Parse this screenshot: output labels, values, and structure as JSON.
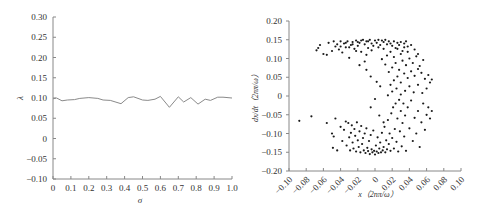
{
  "chart_data": [
    {
      "type": "line",
      "title": "",
      "xlabel": "σ",
      "ylabel": "λ",
      "xlim": [
        0,
        1.0
      ],
      "ylim": [
        -0.1,
        0.3
      ],
      "xticks": [
        "0",
        "0.1",
        "0.2",
        "0.3",
        "0.4",
        "0.5",
        "0.6",
        "0.7",
        "0.8",
        "0.9",
        "1.0"
      ],
      "xtick_values": [
        0,
        0.1,
        0.2,
        0.3,
        0.4,
        0.5,
        0.6,
        0.7,
        0.8,
        0.9,
        1.0
      ],
      "yticks": [
        "0.30",
        "0.25",
        "0.20",
        "0.15",
        "0.10",
        "0.05",
        "0",
        "−0.05",
        "−0.10"
      ],
      "ytick_values": [
        0.3,
        0.25,
        0.2,
        0.15,
        0.1,
        0.05,
        0,
        -0.05,
        -0.1
      ],
      "grid": false,
      "series": [
        {
          "name": "λ",
          "x": [
            0,
            0.02,
            0.05,
            0.08,
            0.12,
            0.15,
            0.2,
            0.25,
            0.28,
            0.32,
            0.38,
            0.42,
            0.45,
            0.5,
            0.53,
            0.57,
            0.6,
            0.65,
            0.7,
            0.73,
            0.77,
            0.81,
            0.85,
            0.88,
            0.92,
            0.95,
            1.0
          ],
          "y": [
            0.098,
            0.1,
            0.093,
            0.095,
            0.096,
            0.099,
            0.101,
            0.099,
            0.095,
            0.094,
            0.086,
            0.101,
            0.103,
            0.095,
            0.094,
            0.097,
            0.104,
            0.077,
            0.103,
            0.09,
            0.101,
            0.085,
            0.097,
            0.094,
            0.102,
            0.102,
            0.1
          ]
        }
      ]
    },
    {
      "type": "scatter",
      "title": "",
      "xlabel": "x（2nπ/ω）",
      "ylabel": "dx/dt（2nπ/ω）",
      "xlim": [
        -0.1,
        0.1
      ],
      "ylim": [
        -0.2,
        0.2
      ],
      "xticks": [
        "−0.10",
        "−0.08",
        "−0.06",
        "−0.04",
        "−0.02",
        "0",
        "0.02",
        "0.04",
        "0.06",
        "0.08",
        "0.10"
      ],
      "xtick_values": [
        -0.1,
        -0.08,
        -0.06,
        -0.04,
        -0.02,
        0,
        0.02,
        0.04,
        0.06,
        0.08,
        0.1
      ],
      "yticks": [
        "0.20",
        "0.15",
        "0.10",
        "0.05",
        "0",
        "−0.05",
        "−0.10",
        "−0.15",
        "−0.20"
      ],
      "ytick_values": [
        0.2,
        0.15,
        0.1,
        0.05,
        0,
        -0.05,
        -0.1,
        -0.15,
        -0.2
      ],
      "grid": false,
      "points": [
        [
          -0.088,
          -0.066
        ],
        [
          -0.074,
          -0.054
        ],
        [
          -0.056,
          -0.072
        ],
        [
          -0.05,
          -0.1
        ],
        [
          -0.048,
          -0.108
        ],
        [
          -0.046,
          -0.06
        ],
        [
          -0.049,
          -0.138
        ],
        [
          -0.044,
          -0.145
        ],
        [
          -0.04,
          -0.082
        ],
        [
          -0.038,
          -0.12
        ],
        [
          -0.036,
          -0.09
        ],
        [
          -0.034,
          -0.068
        ],
        [
          -0.033,
          -0.132
        ],
        [
          -0.031,
          -0.072
        ],
        [
          -0.03,
          -0.11
        ],
        [
          -0.029,
          -0.145
        ],
        [
          -0.028,
          -0.098
        ],
        [
          -0.027,
          -0.078
        ],
        [
          -0.026,
          -0.124
        ],
        [
          -0.025,
          -0.14
        ],
        [
          -0.024,
          -0.088
        ],
        [
          -0.023,
          -0.106
        ],
        [
          -0.022,
          -0.148
        ],
        [
          -0.021,
          -0.07
        ],
        [
          -0.02,
          -0.118
        ],
        [
          -0.019,
          -0.136
        ],
        [
          -0.018,
          -0.094
        ],
        [
          -0.017,
          -0.15
        ],
        [
          -0.016,
          -0.08
        ],
        [
          -0.015,
          -0.128
        ],
        [
          -0.014,
          -0.112
        ],
        [
          -0.013,
          -0.145
        ],
        [
          -0.012,
          -0.1
        ],
        [
          -0.011,
          -0.152
        ],
        [
          -0.01,
          -0.086
        ],
        [
          -0.009,
          -0.138
        ],
        [
          -0.008,
          -0.147
        ],
        [
          -0.007,
          -0.12
        ],
        [
          -0.006,
          -0.155
        ],
        [
          -0.005,
          -0.104
        ],
        [
          -0.004,
          -0.142
        ],
        [
          -0.003,
          -0.15
        ],
        [
          -0.002,
          -0.092
        ],
        [
          -0.001,
          -0.146
        ],
        [
          0.0,
          -0.156
        ],
        [
          0.001,
          -0.132
        ],
        [
          0.002,
          -0.148
        ],
        [
          0.003,
          -0.11
        ],
        [
          0.004,
          -0.152
        ],
        [
          0.005,
          -0.14
        ],
        [
          0.006,
          -0.124
        ],
        [
          0.007,
          -0.15
        ],
        [
          0.008,
          -0.098
        ],
        [
          0.009,
          -0.145
        ],
        [
          0.01,
          -0.136
        ],
        [
          0.011,
          -0.082
        ],
        [
          0.012,
          -0.15
        ],
        [
          0.013,
          -0.118
        ],
        [
          0.014,
          -0.142
        ],
        [
          0.015,
          -0.064
        ],
        [
          0.016,
          -0.128
        ],
        [
          0.017,
          -0.1
        ],
        [
          0.018,
          -0.146
        ],
        [
          0.019,
          -0.046
        ],
        [
          0.02,
          -0.112
        ],
        [
          0.021,
          -0.03
        ],
        [
          0.022,
          -0.14
        ],
        [
          0.023,
          -0.088
        ],
        [
          0.024,
          -0.02
        ],
        [
          0.025,
          -0.122
        ],
        [
          0.026,
          -0.06
        ],
        [
          0.027,
          -0.148
        ],
        [
          0.028,
          -0.01
        ],
        [
          0.029,
          -0.094
        ],
        [
          0.03,
          -0.04
        ],
        [
          0.031,
          -0.134
        ],
        [
          0.032,
          -0.072
        ],
        [
          0.033,
          -0.02
        ],
        [
          0.034,
          -0.108
        ],
        [
          0.035,
          -0.052
        ],
        [
          0.036,
          -0.146
        ],
        [
          0.038,
          -0.03
        ],
        [
          0.04,
          -0.086
        ],
        [
          0.042,
          -0.012
        ],
        [
          0.044,
          -0.12
        ],
        [
          0.046,
          -0.058
        ],
        [
          0.048,
          -0.1
        ],
        [
          0.05,
          -0.04
        ],
        [
          0.052,
          -0.136
        ],
        [
          0.054,
          -0.07
        ],
        [
          0.056,
          -0.02
        ],
        [
          0.058,
          -0.09
        ],
        [
          0.06,
          -0.05
        ],
        [
          0.062,
          -0.03
        ],
        [
          0.064,
          -0.06
        ],
        [
          0.066,
          -0.04
        ],
        [
          0.01,
          -0.07
        ],
        [
          0.005,
          -0.052
        ],
        [
          -0.005,
          -0.03
        ],
        [
          0.0,
          -0.008
        ],
        [
          0.015,
          0.002
        ],
        [
          0.02,
          0.012
        ],
        [
          0.025,
          0.02
        ],
        [
          0.03,
          0.004
        ],
        [
          0.035,
          0.014
        ],
        [
          0.04,
          0.026
        ],
        [
          0.045,
          0.01
        ],
        [
          0.05,
          0.03
        ],
        [
          0.055,
          0.008
        ],
        [
          0.06,
          0.02
        ],
        [
          0.064,
          0.036
        ],
        [
          0.066,
          0.044
        ],
        [
          0.018,
          0.03
        ],
        [
          0.022,
          0.042
        ],
        [
          0.026,
          0.052
        ],
        [
          0.03,
          0.036
        ],
        [
          0.034,
          0.06
        ],
        [
          0.038,
          0.048
        ],
        [
          0.042,
          0.066
        ],
        [
          0.046,
          0.054
        ],
        [
          0.05,
          0.072
        ],
        [
          0.054,
          0.062
        ],
        [
          0.058,
          0.046
        ],
        [
          0.062,
          0.056
        ],
        [
          0.016,
          0.064
        ],
        [
          0.02,
          0.076
        ],
        [
          0.024,
          0.088
        ],
        [
          0.028,
          0.07
        ],
        [
          0.032,
          0.094
        ],
        [
          0.036,
          0.082
        ],
        [
          0.04,
          0.1
        ],
        [
          0.044,
          0.088
        ],
        [
          0.048,
          0.106
        ],
        [
          0.052,
          0.08
        ],
        [
          0.056,
          0.096
        ],
        [
          0.012,
          0.084
        ],
        [
          0.008,
          0.098
        ],
        [
          0.014,
          0.108
        ],
        [
          0.018,
          0.118
        ],
        [
          0.022,
          0.104
        ],
        [
          0.026,
          0.126
        ],
        [
          0.03,
          0.112
        ],
        [
          0.034,
          0.13
        ],
        [
          0.038,
          0.118
        ],
        [
          0.042,
          0.136
        ],
        [
          0.046,
          0.124
        ],
        [
          0.05,
          0.112
        ],
        [
          -0.005,
          0.052
        ],
        [
          -0.01,
          0.07
        ],
        [
          -0.012,
          0.092
        ],
        [
          0.002,
          0.038
        ],
        [
          0.006,
          0.026
        ],
        [
          -0.066,
          0.128
        ],
        [
          -0.068,
          0.122
        ],
        [
          -0.064,
          0.136
        ],
        [
          -0.06,
          0.112
        ],
        [
          -0.056,
          0.11
        ],
        [
          -0.054,
          0.142
        ],
        [
          -0.05,
          0.12
        ],
        [
          -0.048,
          0.146
        ],
        [
          -0.046,
          0.132
        ],
        [
          -0.044,
          0.138
        ],
        [
          -0.042,
          0.124
        ],
        [
          -0.04,
          0.146
        ],
        [
          -0.038,
          0.116
        ],
        [
          -0.036,
          0.14
        ],
        [
          -0.034,
          0.13
        ],
        [
          -0.032,
          0.146
        ],
        [
          -0.03,
          0.102
        ],
        [
          -0.028,
          0.136
        ],
        [
          -0.026,
          0.144
        ],
        [
          -0.024,
          0.126
        ],
        [
          -0.022,
          0.148
        ],
        [
          -0.02,
          0.134
        ],
        [
          -0.018,
          0.142
        ],
        [
          -0.016,
          0.118
        ],
        [
          -0.014,
          0.15
        ],
        [
          -0.012,
          0.138
        ],
        [
          -0.01,
          0.146
        ],
        [
          -0.008,
          0.128
        ],
        [
          -0.006,
          0.15
        ],
        [
          -0.004,
          0.14
        ],
        [
          -0.002,
          0.134
        ],
        [
          0.0,
          0.148
        ],
        [
          0.002,
          0.142
        ],
        [
          0.004,
          0.15
        ],
        [
          0.006,
          0.136
        ],
        [
          0.008,
          0.148
        ],
        [
          0.01,
          0.144
        ],
        [
          0.012,
          0.15
        ],
        [
          0.014,
          0.138
        ],
        [
          0.016,
          0.146
        ],
        [
          0.018,
          0.14
        ],
        [
          0.02,
          0.134
        ],
        [
          0.022,
          0.146
        ],
        [
          0.024,
          0.128
        ],
        [
          0.026,
          0.142
        ],
        [
          0.028,
          0.136
        ],
        [
          0.03,
          0.144
        ],
        [
          0.032,
          0.12
        ],
        [
          0.034,
          0.14
        ],
        [
          0.036,
          0.146
        ],
        [
          0.038,
          0.132
        ],
        [
          -0.018,
          0.082
        ],
        [
          -0.01,
          0.11
        ],
        [
          -0.022,
          0.12
        ],
        [
          -0.03,
          0.13
        ],
        [
          -0.004,
          0.122
        ],
        [
          -0.008,
          0.146
        ],
        [
          -0.016,
          0.148
        ],
        [
          -0.02,
          0.144
        ],
        [
          0.004,
          0.13
        ],
        [
          0.01,
          0.126
        ],
        [
          -0.026,
          0.138
        ],
        [
          -0.034,
          0.142
        ],
        [
          -0.04,
          0.132
        ]
      ]
    }
  ]
}
